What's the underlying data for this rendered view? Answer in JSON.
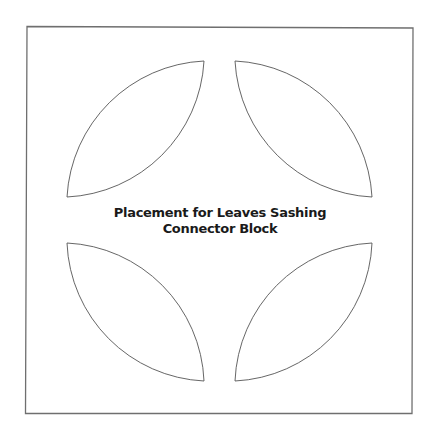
{
  "diagram": {
    "title_lines": [
      "Placement for Leaves Sashing",
      "Connector Block"
    ],
    "colors": {
      "background": "#ffffff",
      "border": "#6f6f6f",
      "leaf_outline": "#555555",
      "text": "#1a1a1a"
    },
    "block": {
      "shape": "square",
      "outline": true
    },
    "leaves": [
      {
        "position": "top-left",
        "shape": "leaf"
      },
      {
        "position": "top-right",
        "shape": "leaf"
      },
      {
        "position": "bottom-left",
        "shape": "leaf"
      },
      {
        "position": "bottom-right",
        "shape": "leaf"
      }
    ]
  }
}
